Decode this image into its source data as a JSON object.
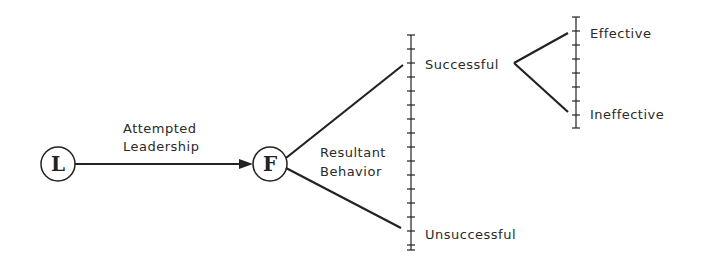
{
  "nodes": {
    "leader": "L",
    "follower": "F"
  },
  "labels": {
    "attempted_line1": "Attempted",
    "attempted_line2": "Leadership",
    "resultant_line1": "Resultant",
    "resultant_line2": "Behavior",
    "successful": "Successful",
    "unsuccessful": "Unsuccessful",
    "effective": "Effective",
    "ineffective": "Ineffective"
  },
  "colors": {
    "line": "#222222",
    "background": "#ffffff"
  }
}
